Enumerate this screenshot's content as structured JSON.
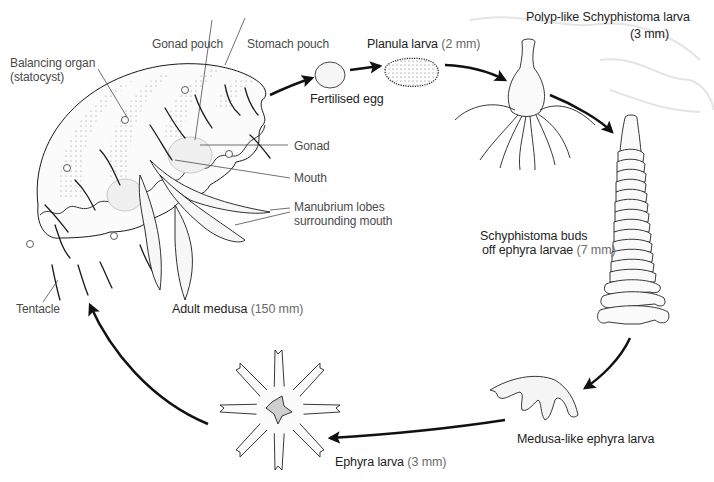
{
  "diagram": {
    "stages": [
      {
        "id": "adult",
        "name": "Adult medusa",
        "size": "(150 mm)"
      },
      {
        "id": "egg",
        "name": "Fertilised egg",
        "size": ""
      },
      {
        "id": "planula",
        "name": "Planula larva",
        "size": "(2 mm)"
      },
      {
        "id": "polyp",
        "name": "Polyp-like Schyphistoma larva",
        "size": "(3 mm)"
      },
      {
        "id": "strobila",
        "name": "Schyphistoma buds",
        "name2": "off ephyra larvae",
        "size": "(7 mm)"
      },
      {
        "id": "ephyra_side",
        "name": "Medusa-like ephyra larva",
        "size": ""
      },
      {
        "id": "ephyra",
        "name": "Ephyra larva",
        "size": "(3 mm)"
      }
    ],
    "parts": [
      {
        "id": "statocyst",
        "line1": "Balancing organ",
        "line2": "(statocyst)"
      },
      {
        "id": "gonad_pouch",
        "line1": "Gonad pouch"
      },
      {
        "id": "stomach_pouch",
        "line1": "Stomach pouch"
      },
      {
        "id": "gonad",
        "line1": "Gonad"
      },
      {
        "id": "mouth",
        "line1": "Mouth"
      },
      {
        "id": "manubrium",
        "line1": "Manubrium lobes",
        "line2": "surrounding mouth"
      },
      {
        "id": "tentacle",
        "line1": "Tentacle"
      }
    ],
    "colors": {
      "ink": "#1a1a1a",
      "label": "#3a3a3a",
      "size_text": "#6a6a6a",
      "shading": "#d8d8d8",
      "background": "#ffffff"
    },
    "arrows": [
      {
        "from": "adult",
        "to": "egg"
      },
      {
        "from": "egg",
        "to": "planula"
      },
      {
        "from": "planula",
        "to": "polyp"
      },
      {
        "from": "polyp",
        "to": "strobila"
      },
      {
        "from": "strobila",
        "to": "ephyra_side"
      },
      {
        "from": "ephyra_side",
        "to": "ephyra"
      },
      {
        "from": "ephyra",
        "to": "adult"
      }
    ]
  }
}
